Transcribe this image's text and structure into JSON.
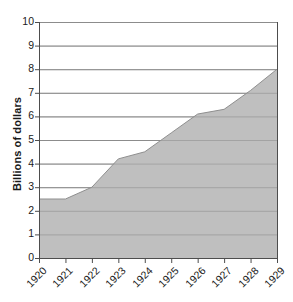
{
  "chart_data": {
    "type": "area",
    "title": "",
    "xlabel": "",
    "ylabel": "Billions of dollars",
    "categories": [
      "1920",
      "1921",
      "1922",
      "1923",
      "1924",
      "1925",
      "1926",
      "1927",
      "1928",
      "1929"
    ],
    "values": [
      2.5,
      2.5,
      3.0,
      4.2,
      4.5,
      5.3,
      6.1,
      6.3,
      7.1,
      8.0
    ],
    "series": [
      {
        "name": "Billions of dollars",
        "values": [
          2.5,
          2.5,
          3.0,
          4.2,
          4.5,
          5.3,
          6.1,
          6.3,
          7.1,
          8.0
        ]
      }
    ],
    "ylim": [
      0,
      10
    ],
    "ytick_labels": [
      "0",
      "1",
      "2",
      "3",
      "4",
      "5",
      "6",
      "7",
      "8",
      "9",
      "10"
    ],
    "ytick_values": [
      0,
      1,
      2,
      3,
      4,
      5,
      6,
      7,
      8,
      9,
      10
    ],
    "grid": true,
    "legend": "none",
    "colors": {
      "area_fill": "#bfbfbf",
      "gridline": "#8c8c8c",
      "axis_line": "#4d4d4d",
      "text": "#1a1a1a",
      "background": "#ffffff"
    }
  },
  "axis": {
    "y_title": "Billions of dollars"
  }
}
